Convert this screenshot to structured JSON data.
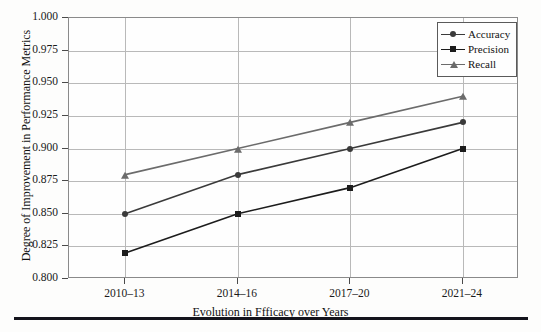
{
  "chart_data": {
    "type": "line",
    "title": "",
    "xlabel": "Evolution in Ffficacy over Years",
    "ylabel": "Degree of Improvement in Performance Metrics",
    "categories": [
      "2010–13",
      "2014–16",
      "2017–20",
      "2021–24"
    ],
    "ylim": [
      0.8,
      1.0
    ],
    "yticks": [
      "0.800",
      "0.825",
      "0.850",
      "0.875",
      "0.900",
      "0.925",
      "0.950",
      "0.975",
      "1.000"
    ],
    "ytick_values": [
      0.8,
      0.825,
      0.85,
      0.875,
      0.9,
      0.925,
      0.95,
      0.975,
      1.0
    ],
    "grid": true,
    "legend_position": "top-right",
    "series": [
      {
        "name": "Accuracy",
        "marker": "circle",
        "color": "#3a3a3a",
        "values": [
          0.85,
          0.88,
          0.9,
          0.92
        ]
      },
      {
        "name": "Precision",
        "marker": "square",
        "color": "#1c1c1c",
        "values": [
          0.82,
          0.85,
          0.87,
          0.9
        ]
      },
      {
        "name": "Recall",
        "marker": "triangle",
        "color": "#6b6b6b",
        "values": [
          0.88,
          0.9,
          0.92,
          0.94
        ]
      }
    ]
  },
  "legend": {
    "items": [
      {
        "label": "Accuracy"
      },
      {
        "label": "Precision"
      },
      {
        "label": "Recall"
      }
    ]
  },
  "colors": {
    "accuracy": "#3a3a3a",
    "precision": "#1c1c1c",
    "recall": "#6b6b6b",
    "grid": "#b9b9b9",
    "frame": "#8a8a8a",
    "rule": "#14141c"
  }
}
